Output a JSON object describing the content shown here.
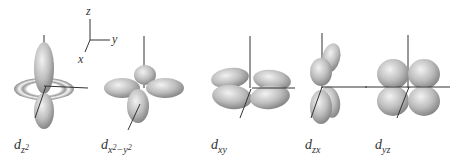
{
  "axes_legend": {
    "x": "x",
    "y": "y",
    "z": "z"
  },
  "orbitals": [
    {
      "id": "dz2",
      "base": "d",
      "sub": "z",
      "sub_sup": "2",
      "sub2": "",
      "sub2_sup": ""
    },
    {
      "id": "dx2-y2",
      "base": "d",
      "sub": "x",
      "sub_sup": "2",
      "sub2": "−y",
      "sub2_sup": "2"
    },
    {
      "id": "dxy",
      "base": "d",
      "sub": "xy",
      "sub_sup": "",
      "sub2": "",
      "sub2_sup": ""
    },
    {
      "id": "dzx",
      "base": "d",
      "sub": "zx",
      "sub_sup": "",
      "sub2": "",
      "sub2_sup": ""
    },
    {
      "id": "dyz",
      "base": "d",
      "sub": "yz",
      "sub_sup": "",
      "sub2": "",
      "sub2_sup": ""
    }
  ],
  "colors": {
    "lobe_light": "#e6e6e6",
    "lobe_dark": "#8a8a8a",
    "axis": "#333333"
  }
}
